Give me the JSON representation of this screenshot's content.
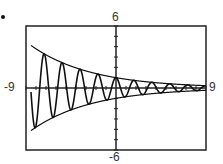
{
  "chart_data": {
    "type": "line",
    "title": "",
    "xlabel": "",
    "ylabel": "",
    "xlim": [
      -9,
      9
    ],
    "ylim": [
      -6,
      6
    ],
    "grid": false,
    "tick_marks": {
      "x_step": 1,
      "y_step": 1
    },
    "labels": {
      "ymax": "6",
      "ymin": "-6",
      "xmin": "-9",
      "xmax": "9"
    },
    "series": [
      {
        "name": "damped oscillation",
        "function": "e^(-x/6) * cos(3.5x)",
        "x": [
          -9,
          -7,
          -5,
          -3,
          -1,
          0,
          1,
          3,
          5,
          7,
          9
        ],
        "values": [
          4.48,
          3.2,
          2.28,
          1.65,
          1.18,
          1.0,
          0.85,
          0.6,
          0.43,
          0.31,
          0.22
        ]
      },
      {
        "name": "upper envelope",
        "function": "e^(-x/6)",
        "x": [
          -9,
          -6,
          -3,
          0,
          3,
          6,
          9
        ],
        "values": [
          4.48,
          2.72,
          1.65,
          1.0,
          0.61,
          0.37,
          0.22
        ]
      },
      {
        "name": "lower envelope",
        "function": "-e^(-x/6)",
        "x": [
          -9,
          -6,
          -3,
          0,
          3,
          6,
          9
        ],
        "values": [
          -4.48,
          -2.72,
          -1.65,
          -1.0,
          -0.61,
          -0.37,
          -0.22
        ]
      }
    ]
  },
  "marker": "•"
}
